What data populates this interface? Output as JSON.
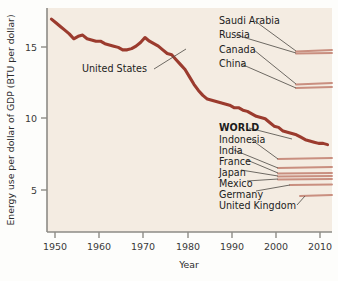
{
  "figure": {
    "background_color": "#fdfdfb",
    "plot_background_color": "#f4ece2",
    "axis_color": "#8d8b86",
    "highlight_color": "#9b3b2e",
    "faint_line_color": "#c98f80",
    "leader_color": "#55514c"
  },
  "chart_data": {
    "type": "line",
    "title": "",
    "xlabel": "Year",
    "ylabel": "Energy use per dollar of GDP (BTU per dollar)",
    "xlim": [
      1948,
      2012
    ],
    "ylim": [
      0,
      18.2
    ],
    "xticks": [
      1950,
      1960,
      1970,
      1980,
      1990,
      2000,
      2010
    ],
    "xtick_labels": [
      "1950",
      "1960",
      "1970",
      "1980",
      "1990",
      "2000",
      "2010"
    ],
    "yticks": [
      5,
      10,
      15
    ],
    "ytick_labels": [
      "5",
      "10",
      "15"
    ],
    "grid": false,
    "legend_position": "inline-annotations",
    "series": [
      {
        "name": "United States",
        "emphasis": "thick",
        "label_position": "left-inline",
        "x": [
          1949,
          1950,
          1951,
          1952,
          1953,
          1954,
          1955,
          1956,
          1957,
          1958,
          1959,
          1960,
          1961,
          1962,
          1963,
          1964,
          1965,
          1966,
          1967,
          1968,
          1969,
          1970,
          1971,
          1972,
          1973,
          1974,
          1975,
          1976,
          1977,
          1978,
          1979,
          1980,
          1981,
          1982,
          1983,
          1984,
          1985,
          1986,
          1987,
          1988,
          1989,
          1990,
          1991,
          1992,
          1993,
          1994,
          1995,
          1996,
          1997,
          1998,
          1999,
          2000,
          2001,
          2002,
          2003,
          2004,
          2005,
          2006,
          2007,
          2008,
          2009,
          2010,
          2011
        ],
        "values": [
          17.3,
          17.0,
          16.7,
          16.4,
          16.1,
          15.7,
          15.9,
          16.0,
          15.7,
          15.6,
          15.5,
          15.5,
          15.3,
          15.2,
          15.1,
          15.0,
          14.8,
          14.8,
          14.9,
          15.1,
          15.4,
          15.8,
          15.5,
          15.3,
          15.1,
          14.8,
          14.5,
          14.4,
          14.0,
          13.6,
          13.2,
          12.6,
          12.0,
          11.5,
          11.1,
          10.8,
          10.7,
          10.6,
          10.5,
          10.4,
          10.3,
          10.1,
          10.1,
          9.9,
          9.8,
          9.6,
          9.4,
          9.3,
          9.2,
          8.9,
          8.6,
          8.5,
          8.2,
          8.1,
          8.0,
          7.9,
          7.7,
          7.5,
          7.4,
          7.3,
          7.2,
          7.2,
          7.1
        ]
      },
      {
        "name": "Saudi Arabia",
        "emphasis": "faint",
        "label_position": "right-annotation",
        "end_value": 14.6
      },
      {
        "name": "Russia",
        "emphasis": "faint",
        "label_position": "right-annotation",
        "end_value": 14.4
      },
      {
        "name": "Canada",
        "emphasis": "faint",
        "label_position": "right-annotation",
        "end_value": 10.6
      },
      {
        "name": "China",
        "emphasis": "faint",
        "label_position": "right-annotation",
        "end_value": 10.3
      },
      {
        "name": "WORLD",
        "emphasis": "thick",
        "label_position": "right-annotation",
        "end_value": 7.2
      },
      {
        "name": "Indonesia",
        "emphasis": "faint",
        "label_position": "right-annotation",
        "end_value": 6.2
      },
      {
        "name": "India",
        "emphasis": "faint",
        "label_position": "right-annotation",
        "end_value": 5.6
      },
      {
        "name": "France",
        "emphasis": "faint",
        "label_position": "right-annotation",
        "end_value": 5.2
      },
      {
        "name": "Japan",
        "emphasis": "faint",
        "label_position": "right-annotation",
        "end_value": 5.1
      },
      {
        "name": "Mexico",
        "emphasis": "faint",
        "label_position": "right-annotation",
        "end_value": 5.0
      },
      {
        "name": "Germany",
        "emphasis": "faint",
        "label_position": "right-annotation",
        "end_value": 4.6
      },
      {
        "name": "United Kingdom",
        "emphasis": "faint",
        "label_position": "right-annotation",
        "end_value": 3.9
      }
    ]
  },
  "annotations": {
    "united_states": "United States",
    "saudi_arabia": "Saudi Arabia",
    "russia": "Russia",
    "canada": "Canada",
    "china": "China",
    "world": "WORLD",
    "indonesia": "Indonesia",
    "india": "India",
    "france": "France",
    "japan": "Japan",
    "mexico": "Mexico",
    "germany": "Germany",
    "united_kingdom": "United Kingdom"
  },
  "axes": {
    "x_title": "Year",
    "y_title": "Energy use per dollar of GDP (BTU per dollar)",
    "x_tick_1950": "1950",
    "x_tick_1960": "1960",
    "x_tick_1970": "1970",
    "x_tick_1980": "1980",
    "x_tick_1990": "1990",
    "x_tick_2000": "2000",
    "x_tick_2010": "2010",
    "y_tick_5": "5",
    "y_tick_10": "10",
    "y_tick_15": "15"
  }
}
